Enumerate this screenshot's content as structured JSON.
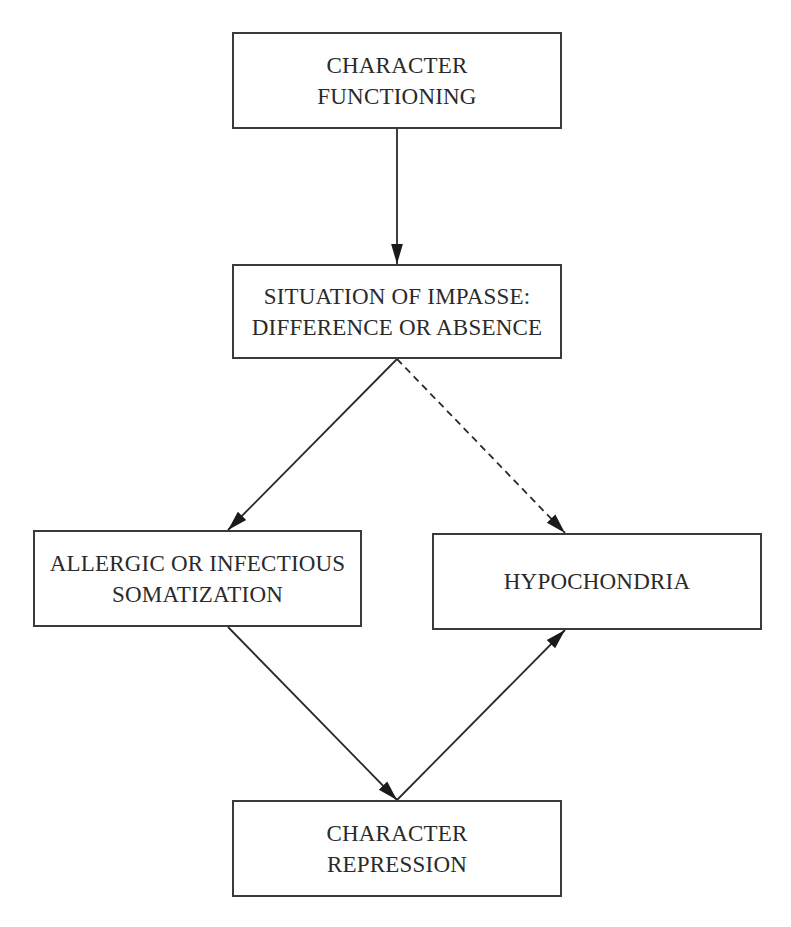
{
  "diagram": {
    "type": "flowchart",
    "nodes": [
      {
        "id": "character_functioning",
        "lines": [
          "CHARACTER",
          "FUNCTIONING"
        ]
      },
      {
        "id": "situation_of_impasse",
        "lines": [
          "SITUATION OF IMPASSE:",
          "DIFFERENCE OR ABSENCE"
        ]
      },
      {
        "id": "allergic_somatization",
        "lines": [
          "ALLERGIC OR INFECTIOUS",
          "SOMATIZATION"
        ]
      },
      {
        "id": "hypochondria",
        "lines": [
          "HYPOCHONDRIA"
        ]
      },
      {
        "id": "character_repression",
        "lines": [
          "CHARACTER",
          "REPRESSION"
        ]
      }
    ],
    "edges": [
      {
        "from": "character_functioning",
        "to": "situation_of_impasse",
        "style": "solid"
      },
      {
        "from": "situation_of_impasse",
        "to": "allergic_somatization",
        "style": "solid"
      },
      {
        "from": "situation_of_impasse",
        "to": "hypochondria",
        "style": "dashed"
      },
      {
        "from": "allergic_somatization",
        "to": "character_repression",
        "style": "solid"
      },
      {
        "from": "character_repression",
        "to": "hypochondria",
        "style": "solid"
      }
    ],
    "colors": {
      "stroke": "#2a2a2a",
      "background": "#ffffff"
    }
  }
}
